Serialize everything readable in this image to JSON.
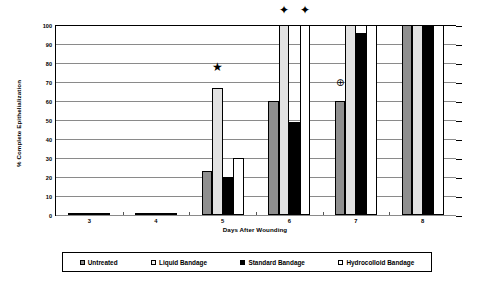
{
  "chart_data": {
    "type": "bar",
    "title": "",
    "xlabel": "Days After Wounding",
    "ylabel": "% Complete Epithelialization",
    "categories": [
      "3",
      "4",
      "5",
      "6",
      "7",
      "8"
    ],
    "ylim": [
      0,
      100
    ],
    "yticks": [
      0,
      10,
      20,
      30,
      40,
      50,
      60,
      70,
      80,
      90,
      100
    ],
    "grid": true,
    "legend_position": "bottom",
    "series": [
      {
        "name": "Untreated",
        "swatch": "untreated",
        "color": "#8f8f8f",
        "values": [
          0,
          0,
          23,
          60,
          60,
          100
        ]
      },
      {
        "name": "Liquid Bandage",
        "swatch": "liquid",
        "color": "#e2e2e2",
        "values": [
          0,
          0,
          67,
          100,
          100,
          100
        ]
      },
      {
        "name": "Standard Bandage",
        "swatch": "standard",
        "color": "#000000",
        "values": [
          0,
          0,
          20,
          49,
          96,
          100
        ]
      },
      {
        "name": "Hydrocolloid Bandage",
        "swatch": "hydrocolloid",
        "color": "#ffffff",
        "values": [
          0,
          0,
          30,
          100,
          100,
          100
        ]
      }
    ],
    "annotations": [
      {
        "symbol": "★",
        "glyph_name": "filled-five-point-star",
        "category": "5",
        "series": "Liquid Bandage",
        "value": 76
      },
      {
        "symbol": "✦",
        "glyph_name": "four-point-star",
        "category": "6",
        "series": "Liquid Bandage",
        "value": 106
      },
      {
        "symbol": "✦",
        "glyph_name": "four-point-star",
        "category": "6",
        "series": "Hydrocolloid Bandage",
        "value": 106
      },
      {
        "symbol": "⊕",
        "glyph_name": "circled-plus",
        "category": "7",
        "series": "Untreated",
        "value": 67
      }
    ]
  }
}
